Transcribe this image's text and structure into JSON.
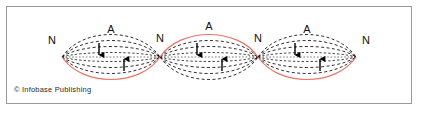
{
  "figure": {
    "credit": "© Infobase Publishing",
    "frame": {
      "border_color": "#9a9a9a",
      "background_color": "#ffffff"
    },
    "colors": {
      "wave_red": "#e8736b",
      "envelope_dashed": "#1a1a1a",
      "axis_dotted": "#7a7a7a",
      "label_text": "#111111",
      "arrow": "#000000"
    },
    "axis": {
      "y": 57,
      "x_start": 62,
      "x_end": 356,
      "style": "dotted"
    },
    "nodes": [
      {
        "label": "N",
        "x": 62,
        "y": 57,
        "label_x": 52,
        "label_y": 44
      },
      {
        "label": "N",
        "x": 160,
        "y": 57,
        "label_x": 160,
        "label_y": 42
      },
      {
        "label": "N",
        "x": 258,
        "y": 57,
        "label_x": 258,
        "label_y": 42
      },
      {
        "label": "N",
        "x": 356,
        "y": 57,
        "label_x": 366,
        "label_y": 44
      }
    ],
    "antinodes": [
      {
        "label": "A",
        "x": 111,
        "y": 57,
        "label_x": 111,
        "label_y": 33,
        "red_side": "bottom"
      },
      {
        "label": "A",
        "x": 209,
        "y": 57,
        "label_x": 209,
        "label_y": 30,
        "red_side": "top"
      },
      {
        "label": "A",
        "x": 307,
        "y": 57,
        "label_x": 307,
        "label_y": 33,
        "red_side": "bottom"
      }
    ],
    "loops": [
      {
        "index": 1,
        "x_left": 62,
        "x_right": 160,
        "amplitude": 15,
        "red_side": "bottom",
        "envelope_amplitudes": [
          15,
          11,
          7,
          3
        ]
      },
      {
        "index": 2,
        "x_left": 160,
        "x_right": 258,
        "amplitude": 15,
        "red_side": "top",
        "envelope_amplitudes": [
          15,
          11,
          7,
          3
        ]
      },
      {
        "index": 3,
        "x_left": 258,
        "x_right": 356,
        "amplitude": 15,
        "red_side": "bottom",
        "envelope_amplitudes": [
          15,
          11,
          7,
          3
        ]
      }
    ],
    "arrows": [
      {
        "direction": "down",
        "x": 99,
        "y_top": 44,
        "y_bottom": 58
      },
      {
        "direction": "up",
        "x": 124,
        "y_top": 56,
        "y_bottom": 71
      },
      {
        "direction": "down",
        "x": 197,
        "y_top": 44,
        "y_bottom": 58
      },
      {
        "direction": "up",
        "x": 222,
        "y_top": 56,
        "y_bottom": 71
      },
      {
        "direction": "down",
        "x": 295,
        "y_top": 44,
        "y_bottom": 58
      },
      {
        "direction": "up",
        "x": 320,
        "y_top": 56,
        "y_bottom": 71
      }
    ]
  }
}
